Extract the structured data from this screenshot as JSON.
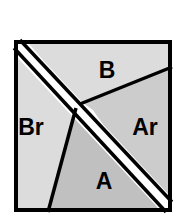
{
  "figure": {
    "name": "partitioned-square-diagram",
    "background_color": "#ffffff",
    "canvas": {
      "width": 184,
      "height": 224
    },
    "square": {
      "left": 14,
      "top": 40,
      "right": 172,
      "bottom": 212,
      "border_color": "#000000",
      "border_width": 4
    },
    "diagonal_band": {
      "description": "white band from top-left corner to bottom-right corner",
      "color": "#ffffff",
      "edge_color": "#000000",
      "edge_width": 3.5,
      "half_width": 7
    },
    "regions": [
      {
        "key": "B",
        "label": "B",
        "fill": "#dcdcdc",
        "label_x": 107,
        "label_y": 78,
        "label_size": 23
      },
      {
        "key": "Ar",
        "label": "Ar",
        "fill": "#cccccc",
        "label_x": 145,
        "label_y": 135,
        "label_size": 23
      },
      {
        "key": "Br",
        "label": "Br",
        "fill": "#dcdcdc",
        "label_x": 31,
        "label_y": 135,
        "label_size": 23
      },
      {
        "key": "A",
        "label": "A",
        "fill": "#c0c0c0",
        "label_x": 104,
        "label_y": 189,
        "label_size": 23
      }
    ],
    "divider_lines": [
      {
        "name": "b-ar-divider",
        "x1": 83,
        "y1": 103,
        "x2": 172,
        "y2": 67,
        "color": "#000000",
        "width": 3.5
      },
      {
        "name": "a-br-divider",
        "x1": 76,
        "y1": 110,
        "x2": 48,
        "y2": 212,
        "color": "#000000",
        "width": 3.5
      }
    ]
  }
}
